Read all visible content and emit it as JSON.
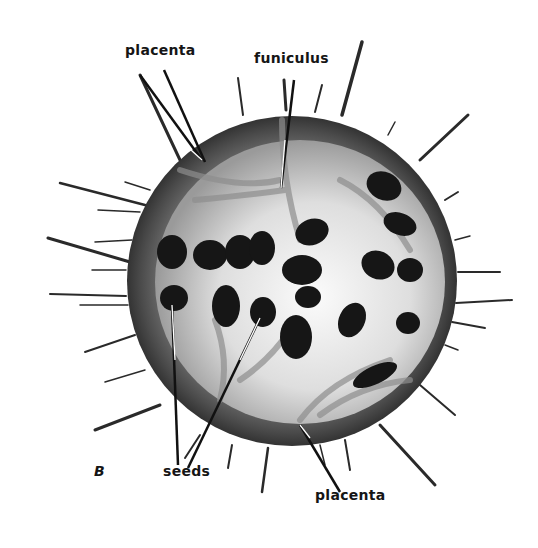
{
  "figure": {
    "panel_letter": "B",
    "labels": {
      "placenta_top": "placenta",
      "funiculus": "funiculus",
      "seeds": "seeds",
      "placenta_bottom": "placenta"
    },
    "colors": {
      "background": "#ffffff",
      "rind": "#4a4a4a",
      "flesh": "#e8e8e8",
      "seed": "#161616",
      "text": "#151515"
    }
  }
}
